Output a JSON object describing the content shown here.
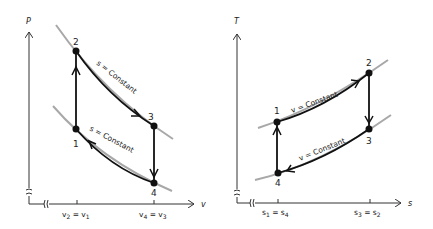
{
  "diagrams": [
    {
      "id": "pv",
      "y_axis_label": "P",
      "x_axis_label": "v",
      "x_ticks": [
        {
          "label": "v",
          "sub1": "2",
          "eq": " = ",
          "label2": "v",
          "sub2": "1"
        },
        {
          "label": "v",
          "sub1": "4",
          "eq": " = ",
          "label2": "v",
          "sub2": "3"
        }
      ],
      "points": [
        {
          "label": "1"
        },
        {
          "label": "2"
        },
        {
          "label": "3"
        },
        {
          "label": "4"
        }
      ],
      "process_labels": [
        "s = Constant",
        "s = Constant"
      ]
    },
    {
      "id": "ts",
      "y_axis_label": "T",
      "x_axis_label": "s",
      "x_ticks": [
        {
          "label": "s",
          "sub1": "1",
          "eq": " = ",
          "label2": "s",
          "sub2": "4"
        },
        {
          "label": "s",
          "sub1": "3",
          "eq": " = ",
          "label2": "s",
          "sub2": "2"
        }
      ],
      "points": [
        {
          "label": "1"
        },
        {
          "label": "2"
        },
        {
          "label": "3"
        },
        {
          "label": "4"
        }
      ],
      "process_labels": [
        "v = Constant",
        "v = Constant"
      ]
    }
  ],
  "colors": {
    "line": "#111111",
    "curve": "#a8a8a8",
    "axis": "#333333"
  }
}
